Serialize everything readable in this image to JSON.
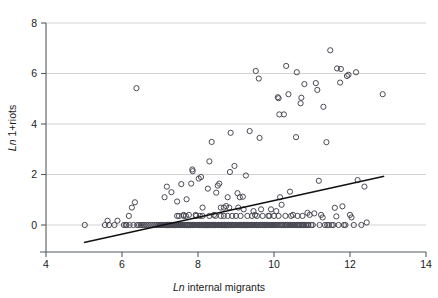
{
  "chart_data": {
    "type": "scatter",
    "title": "",
    "xlabel": "Ln internal migrants",
    "xlabel_italic_prefix": "Ln",
    "xlabel_rest": " internal migrants",
    "ylabel": "Ln 1+riots",
    "ylabel_italic_prefix": "Ln",
    "ylabel_rest": " 1+riots",
    "xlim": [
      4,
      14
    ],
    "ylim": [
      -0.75,
      8.2
    ],
    "xticks": [
      4,
      6,
      8,
      10,
      12,
      14
    ],
    "yticks": [
      0,
      2,
      4,
      6,
      8
    ],
    "xtick_labels": [
      "4",
      "6",
      "8",
      "10",
      "12",
      "14"
    ],
    "ytick_labels": [
      "0",
      "2",
      "4",
      "6",
      "8"
    ],
    "grid": "horizontal",
    "grid_color": "#c8c8c8",
    "legend": "none",
    "marker": "open-circle",
    "marker_color": "#4a4a55",
    "marker_radius": 2.6,
    "fit_line": {
      "name": "linear fit",
      "color": "#111111",
      "x_start": 5.0,
      "y_start": -0.69,
      "x_end": 12.9,
      "y_end": 1.93
    },
    "points": [
      [
        5.02,
        0.0
      ],
      [
        5.55,
        0.0
      ],
      [
        5.62,
        0.17
      ],
      [
        5.66,
        0.0
      ],
      [
        5.8,
        0.0
      ],
      [
        5.88,
        0.17
      ],
      [
        6.05,
        0.0
      ],
      [
        6.1,
        0.0
      ],
      [
        6.12,
        0.0
      ],
      [
        6.18,
        0.36
      ],
      [
        6.2,
        0.0
      ],
      [
        6.26,
        0.69
      ],
      [
        6.3,
        0.0
      ],
      [
        6.34,
        0.9
      ],
      [
        6.38,
        5.42
      ],
      [
        6.4,
        0.0
      ],
      [
        6.45,
        0.0
      ],
      [
        6.5,
        0.0
      ],
      [
        6.55,
        0.0
      ],
      [
        6.6,
        0.0
      ],
      [
        6.65,
        0.0
      ],
      [
        6.7,
        0.0
      ],
      [
        6.75,
        0.0
      ],
      [
        6.8,
        0.0
      ],
      [
        6.85,
        0.0
      ],
      [
        6.9,
        0.0
      ],
      [
        6.95,
        0.0
      ],
      [
        7.0,
        0.0
      ],
      [
        7.02,
        0.0
      ],
      [
        7.05,
        0.0
      ],
      [
        7.08,
        0.0
      ],
      [
        7.1,
        0.0
      ],
      [
        7.12,
        1.1
      ],
      [
        7.15,
        0.0
      ],
      [
        7.18,
        1.52
      ],
      [
        7.2,
        0.0
      ],
      [
        7.22,
        0.0
      ],
      [
        7.25,
        0.0
      ],
      [
        7.28,
        0.0
      ],
      [
        7.3,
        1.3
      ],
      [
        7.32,
        0.0
      ],
      [
        7.35,
        0.0
      ],
      [
        7.38,
        0.0
      ],
      [
        7.4,
        0.0
      ],
      [
        7.42,
        0.0
      ],
      [
        7.45,
        0.93
      ],
      [
        7.48,
        0.0
      ],
      [
        7.5,
        0.0
      ],
      [
        7.52,
        0.0
      ],
      [
        7.55,
        0.0
      ],
      [
        7.56,
        1.62
      ],
      [
        7.58,
        0.0
      ],
      [
        7.6,
        0.0
      ],
      [
        7.62,
        0.4
      ],
      [
        7.65,
        0.0
      ],
      [
        7.68,
        0.36
      ],
      [
        7.7,
        1.02
      ],
      [
        7.72,
        0.0
      ],
      [
        7.74,
        0.0
      ],
      [
        7.76,
        0.4
      ],
      [
        7.78,
        0.0
      ],
      [
        7.8,
        0.0
      ],
      [
        7.82,
        1.64
      ],
      [
        7.84,
        0.0
      ],
      [
        7.85,
        2.2
      ],
      [
        7.86,
        2.13
      ],
      [
        7.88,
        0.0
      ],
      [
        7.9,
        0.0
      ],
      [
        7.92,
        0.0
      ],
      [
        7.94,
        0.4
      ],
      [
        7.95,
        0.0
      ],
      [
        7.98,
        0.0
      ],
      [
        8.0,
        0.0
      ],
      [
        8.02,
        1.84
      ],
      [
        8.04,
        0.0
      ],
      [
        8.06,
        0.0
      ],
      [
        8.08,
        1.9
      ],
      [
        8.1,
        0.0
      ],
      [
        8.12,
        0.69
      ],
      [
        8.14,
        0.0
      ],
      [
        8.16,
        0.0
      ],
      [
        8.18,
        0.0
      ],
      [
        8.2,
        0.0
      ],
      [
        8.22,
        0.0
      ],
      [
        8.24,
        0.0
      ],
      [
        8.26,
        1.44
      ],
      [
        8.28,
        0.0
      ],
      [
        8.3,
        2.52
      ],
      [
        8.32,
        0.0
      ],
      [
        8.34,
        0.0
      ],
      [
        8.36,
        3.29
      ],
      [
        8.38,
        0.0
      ],
      [
        8.4,
        0.0
      ],
      [
        8.42,
        0.4
      ],
      [
        8.44,
        0.0
      ],
      [
        8.46,
        0.0
      ],
      [
        8.48,
        1.28
      ],
      [
        8.5,
        0.0
      ],
      [
        8.52,
        1.56
      ],
      [
        8.54,
        0.0
      ],
      [
        8.56,
        1.64
      ],
      [
        8.58,
        0.0
      ],
      [
        8.6,
        0.69
      ],
      [
        8.62,
        0.0
      ],
      [
        8.64,
        0.0
      ],
      [
        8.66,
        0.0
      ],
      [
        8.68,
        0.0
      ],
      [
        8.7,
        0.0
      ],
      [
        8.72,
        0.0
      ],
      [
        8.74,
        0.75
      ],
      [
        8.76,
        0.0
      ],
      [
        8.78,
        1.1
      ],
      [
        8.8,
        0.0
      ],
      [
        8.82,
        0.0
      ],
      [
        8.84,
        2.1
      ],
      [
        8.86,
        3.65
      ],
      [
        8.88,
        0.0
      ],
      [
        8.9,
        0.0
      ],
      [
        8.92,
        0.0
      ],
      [
        8.94,
        0.0
      ],
      [
        8.96,
        2.34
      ],
      [
        8.98,
        0.0
      ],
      [
        9.0,
        0.0
      ],
      [
        9.02,
        0.0
      ],
      [
        9.04,
        1.26
      ],
      [
        9.06,
        0.0
      ],
      [
        9.08,
        0.0
      ],
      [
        9.1,
        1.1
      ],
      [
        9.12,
        0.0
      ],
      [
        9.14,
        0.0
      ],
      [
        9.16,
        0.0
      ],
      [
        9.18,
        1.12
      ],
      [
        9.2,
        0.0
      ],
      [
        9.22,
        0.0
      ],
      [
        9.24,
        0.0
      ],
      [
        9.26,
        1.96
      ],
      [
        9.28,
        0.0
      ],
      [
        9.3,
        0.0
      ],
      [
        9.32,
        0.0
      ],
      [
        9.34,
        0.0
      ],
      [
        9.36,
        3.72
      ],
      [
        9.4,
        0.0
      ],
      [
        9.44,
        0.0
      ],
      [
        9.48,
        0.0
      ],
      [
        9.5,
        0.4
      ],
      [
        9.52,
        6.1
      ],
      [
        9.54,
        0.0
      ],
      [
        9.56,
        0.0
      ],
      [
        9.6,
        5.8
      ],
      [
        9.62,
        3.45
      ],
      [
        9.64,
        0.0
      ],
      [
        9.68,
        0.0
      ],
      [
        9.7,
        0.0
      ],
      [
        9.74,
        0.0
      ],
      [
        9.78,
        0.0
      ],
      [
        9.8,
        0.0
      ],
      [
        9.84,
        0.0
      ],
      [
        9.88,
        0.36
      ],
      [
        9.9,
        0.0
      ],
      [
        9.94,
        0.0
      ],
      [
        9.98,
        0.0
      ],
      [
        10.02,
        0.0
      ],
      [
        10.06,
        0.0
      ],
      [
        10.1,
        5.06
      ],
      [
        10.12,
        5.02
      ],
      [
        10.14,
        4.38
      ],
      [
        10.16,
        1.1
      ],
      [
        10.18,
        0.0
      ],
      [
        10.2,
        0.8
      ],
      [
        10.22,
        0.0
      ],
      [
        10.26,
        4.38
      ],
      [
        10.3,
        0.0
      ],
      [
        10.32,
        6.3
      ],
      [
        10.34,
        0.0
      ],
      [
        10.38,
        5.18
      ],
      [
        10.4,
        0.0
      ],
      [
        10.42,
        1.32
      ],
      [
        10.44,
        0.0
      ],
      [
        10.48,
        0.0
      ],
      [
        10.5,
        0.4
      ],
      [
        10.54,
        0.0
      ],
      [
        10.58,
        3.48
      ],
      [
        10.6,
        6.05
      ],
      [
        10.62,
        0.0
      ],
      [
        10.66,
        0.0
      ],
      [
        10.7,
        4.82
      ],
      [
        10.72,
        5.04
      ],
      [
        10.74,
        0.0
      ],
      [
        10.78,
        0.0
      ],
      [
        10.8,
        5.58
      ],
      [
        10.84,
        0.0
      ],
      [
        10.88,
        0.48
      ],
      [
        10.9,
        0.0
      ],
      [
        10.94,
        0.4
      ],
      [
        10.98,
        0.0
      ],
      [
        11.02,
        0.0
      ],
      [
        11.06,
        0.46
      ],
      [
        11.1,
        5.62
      ],
      [
        11.14,
        5.35
      ],
      [
        11.18,
        1.75
      ],
      [
        11.2,
        0.0
      ],
      [
        11.24,
        0.4
      ],
      [
        11.28,
        0.3
      ],
      [
        11.3,
        4.68
      ],
      [
        11.34,
        0.0
      ],
      [
        11.38,
        3.28
      ],
      [
        11.4,
        0.0
      ],
      [
        11.44,
        0.0
      ],
      [
        11.48,
        6.92
      ],
      [
        11.52,
        0.0
      ],
      [
        11.56,
        0.0
      ],
      [
        11.6,
        0.68
      ],
      [
        11.64,
        0.34
      ],
      [
        11.66,
        6.2
      ],
      [
        11.7,
        0.0
      ],
      [
        11.74,
        5.64
      ],
      [
        11.76,
        6.18
      ],
      [
        11.8,
        0.74
      ],
      [
        11.84,
        0.0
      ],
      [
        11.88,
        0.0
      ],
      [
        11.92,
        5.9
      ],
      [
        11.96,
        5.95
      ],
      [
        12.0,
        0.4
      ],
      [
        12.04,
        0.3
      ],
      [
        12.1,
        0.0
      ],
      [
        12.16,
        6.05
      ],
      [
        12.2,
        1.78
      ],
      [
        12.3,
        0.0
      ],
      [
        12.38,
        1.52
      ],
      [
        12.44,
        0.1
      ],
      [
        12.86,
        5.18
      ],
      [
        7.0,
        0.0
      ],
      [
        7.05,
        0.0
      ],
      [
        7.1,
        0.0
      ],
      [
        7.15,
        0.0
      ],
      [
        7.2,
        0.0
      ],
      [
        7.25,
        0.0
      ],
      [
        7.3,
        0.0
      ],
      [
        7.35,
        0.0
      ],
      [
        7.4,
        0.0
      ],
      [
        7.45,
        0.0
      ],
      [
        7.5,
        0.0
      ],
      [
        7.55,
        0.0
      ],
      [
        7.6,
        0.0
      ],
      [
        7.65,
        0.0
      ],
      [
        7.7,
        0.0
      ],
      [
        7.75,
        0.0
      ],
      [
        7.8,
        0.0
      ],
      [
        7.85,
        0.0
      ],
      [
        7.9,
        0.0
      ],
      [
        7.95,
        0.0
      ],
      [
        8.0,
        0.0
      ],
      [
        8.05,
        0.0
      ],
      [
        8.1,
        0.0
      ],
      [
        8.15,
        0.0
      ],
      [
        8.2,
        0.0
      ],
      [
        8.25,
        0.0
      ],
      [
        8.3,
        0.0
      ],
      [
        8.35,
        0.0
      ],
      [
        8.4,
        0.0
      ],
      [
        8.45,
        0.0
      ],
      [
        8.5,
        0.0
      ],
      [
        8.55,
        0.0
      ],
      [
        8.6,
        0.0
      ],
      [
        8.65,
        0.0
      ],
      [
        8.7,
        0.0
      ],
      [
        8.75,
        0.0
      ],
      [
        8.8,
        0.0
      ],
      [
        8.85,
        0.0
      ],
      [
        8.9,
        0.0
      ],
      [
        8.95,
        0.0
      ],
      [
        9.0,
        0.0
      ],
      [
        9.05,
        0.0
      ],
      [
        9.1,
        0.0
      ],
      [
        9.15,
        0.0
      ],
      [
        9.2,
        0.0
      ],
      [
        9.25,
        0.0
      ],
      [
        9.3,
        0.0
      ],
      [
        9.35,
        0.0
      ],
      [
        9.4,
        0.0
      ],
      [
        9.45,
        0.0
      ],
      [
        9.5,
        0.0
      ],
      [
        9.55,
        0.0
      ],
      [
        9.6,
        0.0
      ],
      [
        9.65,
        0.0
      ],
      [
        9.7,
        0.0
      ],
      [
        9.75,
        0.0
      ],
      [
        9.8,
        0.0
      ],
      [
        9.85,
        0.0
      ],
      [
        9.9,
        0.0
      ],
      [
        9.95,
        0.0
      ],
      [
        10.0,
        0.0
      ],
      [
        10.05,
        0.0
      ],
      [
        10.1,
        0.0
      ],
      [
        10.15,
        0.0
      ],
      [
        10.2,
        0.0
      ],
      [
        10.25,
        0.0
      ],
      [
        10.3,
        0.0
      ],
      [
        10.35,
        0.0
      ],
      [
        10.4,
        0.0
      ],
      [
        10.45,
        0.0
      ],
      [
        10.5,
        0.0
      ],
      [
        10.55,
        0.0
      ],
      [
        10.6,
        0.0
      ],
      [
        10.65,
        0.0
      ],
      [
        10.7,
        0.0
      ],
      [
        10.75,
        0.0
      ],
      [
        10.8,
        0.0
      ],
      [
        10.85,
        0.0
      ],
      [
        10.9,
        0.0
      ],
      [
        7.45,
        0.36
      ],
      [
        7.5,
        0.36
      ],
      [
        7.62,
        0.36
      ],
      [
        7.95,
        0.36
      ],
      [
        8.05,
        0.36
      ],
      [
        8.12,
        0.36
      ],
      [
        8.3,
        0.36
      ],
      [
        8.46,
        0.36
      ],
      [
        8.6,
        0.36
      ],
      [
        8.68,
        0.36
      ],
      [
        8.78,
        0.36
      ],
      [
        8.9,
        0.36
      ],
      [
        9.0,
        0.36
      ],
      [
        9.12,
        0.36
      ],
      [
        9.3,
        0.36
      ],
      [
        9.42,
        0.36
      ],
      [
        9.55,
        0.36
      ],
      [
        9.7,
        0.36
      ],
      [
        9.85,
        0.36
      ],
      [
        10.0,
        0.36
      ],
      [
        10.12,
        0.36
      ],
      [
        10.3,
        0.36
      ],
      [
        10.45,
        0.36
      ],
      [
        10.62,
        0.36
      ],
      [
        10.75,
        0.36
      ],
      [
        8.68,
        0.69
      ],
      [
        8.82,
        0.69
      ],
      [
        9.06,
        0.69
      ],
      [
        9.2,
        0.62
      ],
      [
        9.46,
        0.55
      ],
      [
        9.66,
        0.62
      ],
      [
        9.92,
        0.62
      ],
      [
        10.06,
        0.55
      ]
    ]
  }
}
